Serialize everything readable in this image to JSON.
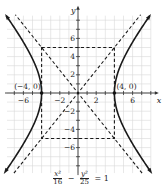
{
  "chart_data": {
    "type": "diagram",
    "equation": {
      "term1_num": "x²",
      "term1_den": "16",
      "minus": "−",
      "term2_num": "y²",
      "term2_den": "25",
      "equals": "= 1"
    },
    "xlabel": "x",
    "ylabel": "y",
    "x_ticks": [
      -6,
      -2,
      2,
      6
    ],
    "x_tick_labels": [
      "−6",
      "−2",
      "2",
      "6"
    ],
    "y_ticks": [
      6,
      4,
      2,
      -2,
      -4,
      -6
    ],
    "y_tick_labels": [
      "6",
      "4",
      "2",
      "−2",
      "−4",
      "−6"
    ],
    "xlim": [
      -7.8,
      8
    ],
    "ylim": [
      -8.8,
      8.5
    ],
    "grid": true,
    "a": 4,
    "b": 5,
    "vertices": [
      {
        "x": -4,
        "y": 0,
        "label": "(−4, 0)"
      },
      {
        "x": 4,
        "y": 0,
        "label": "(4, 0)"
      }
    ],
    "asymptotes": [
      "y = 5x/4",
      "y = −5x/4"
    ],
    "fundamental_rectangle": {
      "x": [
        -4,
        4
      ],
      "y": [
        -5,
        5
      ]
    }
  }
}
